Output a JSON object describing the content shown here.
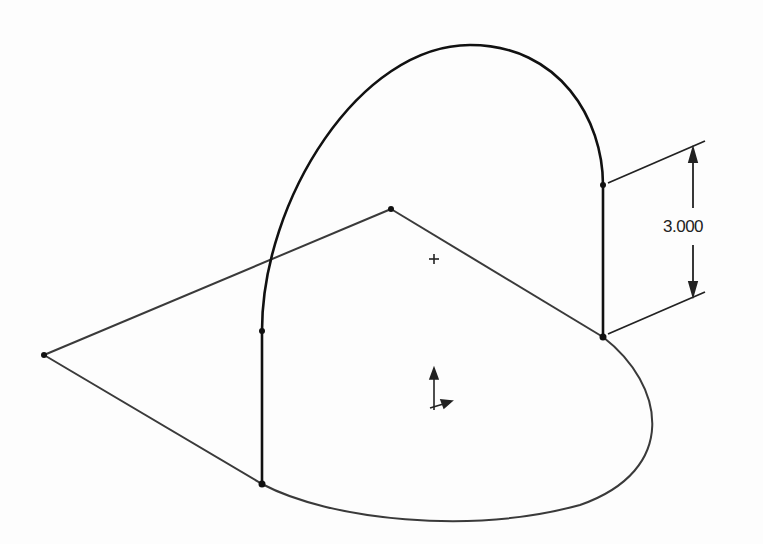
{
  "sketch": {
    "dimension": {
      "value": "3.000",
      "orientation": "vertical"
    },
    "colors": {
      "line": "#3a3a3a",
      "bold_line": "#111111",
      "background": "#fdfdfd"
    },
    "vertices": {
      "left": [
        44,
        355
      ],
      "top": [
        391,
        209
      ],
      "right_base": [
        603,
        337
      ],
      "left_base": [
        262,
        484
      ],
      "left_arc_start": [
        262,
        331
      ],
      "right_arc_start": [
        603,
        185
      ]
    },
    "origin_marker": "plus-icon",
    "triad": "coordinate-triad-icon"
  }
}
